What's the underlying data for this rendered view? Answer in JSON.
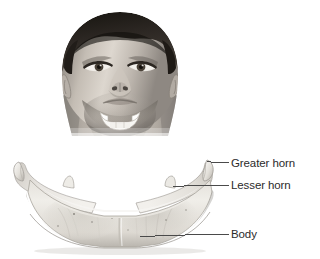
{
  "figure": {
    "background_color": "#ffffff",
    "style": "grayscale anatomical illustration",
    "inset": {
      "name": "head-tilted-back-inset",
      "description": "Frontal view of a young man's head tilted back, showing the neck; the hyoid bone is highlighted in white at the throat",
      "skin_tone": "#b9b2aa",
      "hair_color": "#26221f",
      "highlight_color": "#f4f2ee"
    },
    "specimen": {
      "name": "hyoid-bone-specimen",
      "description": "U-shaped hyoid bone seen from the front and slightly above",
      "bone_color": "#e8e6e1",
      "shadow_color": "#9b9a95"
    }
  },
  "labels": [
    {
      "id": "greater-horn",
      "text": "Greater horn",
      "leader": {
        "from_x": 208,
        "from_y": 161,
        "to_x": 228,
        "to_y": 163
      }
    },
    {
      "id": "lesser-horn",
      "text": "Lesser horn",
      "leader": {
        "from_x": 173,
        "from_y": 186,
        "to_x": 228,
        "to_y": 185
      }
    },
    {
      "id": "body",
      "text": "Body",
      "leader": {
        "from_x": 140,
        "from_y": 236,
        "to_x": 228,
        "to_y": 234
      }
    }
  ],
  "colors": {
    "text": "#2b2b2b",
    "leader_line": "#4a4a4a",
    "background": "#ffffff"
  }
}
